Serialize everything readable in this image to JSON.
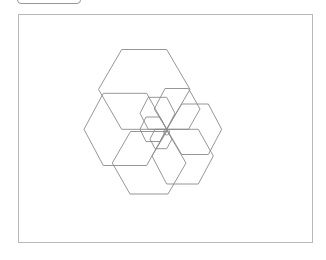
{
  "toolbar": {
    "button_label": ""
  },
  "canvas": {
    "stroke_color": "#8a8a8a",
    "frame_color": "#b8b8b8",
    "shared_center": [
      166.7,
      129.3
    ],
    "hexagons": [
      {
        "name": "hex-top",
        "points": "121.7,49.5 166.7,49.5 190,89.4 166.7,129.3 121.7,129.3 98.5,89.4"
      },
      {
        "name": "hex-left",
        "points": "103.3,93.3 146.7,93.3 166.7,129.3 146.7,165.5 103.3,165.5 84,129.3"
      },
      {
        "name": "hex-bottom",
        "points": "130.5,131.5 167.5,131.5 186,163 168,194 130,194 112.3,163"
      },
      {
        "name": "hex-upper-middle",
        "points": "165,88.5 188.5,88.5 200,109 188.5,129.3 166.7,129.3 154.3,109"
      },
      {
        "name": "hex-right",
        "points": "181.7,104 208.3,104 221.7,129.3 208.3,154.5 181.7,154.5 166.7,129.3"
      },
      {
        "name": "hex-lower-right",
        "points": "168,129.3 198.3,129.3 213.3,156 198.3,184 166.7,184 152,156"
      },
      {
        "name": "hex-upper-left-small",
        "points": "148.3,97.3 166.7,97.3 175,113.3 166.7,129.3 148.3,129.3 140,113.3"
      },
      {
        "name": "hex-center-small",
        "points": "146,117 160,117 166.7,129.3 160,141.5 146,141.5 140,129.3"
      },
      {
        "name": "hex-tiny",
        "points": "155,129.3 166.7,129.3 172,139 166.7,148.7 155,148.7 150,139"
      }
    ],
    "circle": {
      "cx": 166.7,
      "cy": 132,
      "r": 3
    }
  }
}
